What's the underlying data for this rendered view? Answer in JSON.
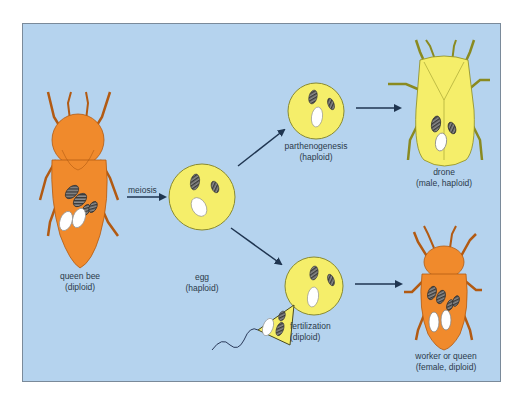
{
  "diagram": {
    "colors": {
      "background": "#b5d3ee",
      "diploid_bee": "#f08a2c",
      "haploid_cell": "#f5ee6a",
      "arrow": "#1f3550",
      "chromosome_dark": "#4a4a4a",
      "chromosome_white": "#ffffff"
    },
    "nodes": {
      "queen": {
        "line1": "queen bee",
        "line2": "(diploid)"
      },
      "egg": {
        "line1": "egg",
        "line2": "(haploid)"
      },
      "parthenogenesis": {
        "line1": "parthenogenesis",
        "line2": "(haploid)"
      },
      "fertilization": {
        "line1": "fertilization",
        "line2": "(diploid)"
      },
      "drone": {
        "line1": "drone",
        "line2": "(male, haploid)"
      },
      "worker": {
        "line1": "worker or queen",
        "line2": "(female, diploid)"
      }
    },
    "edges": {
      "queen_to_egg": "meiosis"
    }
  }
}
